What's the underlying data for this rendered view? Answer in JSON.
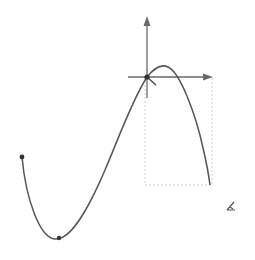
{
  "canvas": {
    "width": 255,
    "height": 260,
    "background": "#ffffff"
  },
  "diagram": {
    "axes": {
      "origin": [
        147,
        77
      ],
      "vertical_axis": {
        "from": [
          147,
          98
        ],
        "to": [
          147,
          18
        ],
        "arrow": "up"
      },
      "horizontal_axis": {
        "from": [
          128,
          77
        ],
        "to": [
          212,
          77
        ],
        "arrow": "right"
      },
      "color": "#6a6a6a"
    },
    "curve": {
      "color": "#555555",
      "start_point": [
        22,
        157
      ],
      "minimum_point": [
        59,
        238
      ],
      "passes_through": [
        147,
        77
      ],
      "peak": [
        166,
        68
      ],
      "end_point": [
        210,
        185
      ]
    },
    "control_points": [
      {
        "name": "start",
        "x": 22,
        "y": 157
      },
      {
        "name": "minimum",
        "x": 59,
        "y": 238
      },
      {
        "name": "origin",
        "x": 147,
        "y": 77
      }
    ],
    "dashed_box": {
      "x": 145,
      "y": 77,
      "width": 67,
      "height": 108,
      "color": "#cfcfcf"
    },
    "cursor": {
      "icon": "pen-cursor-icon",
      "x": 231,
      "y": 205
    }
  }
}
